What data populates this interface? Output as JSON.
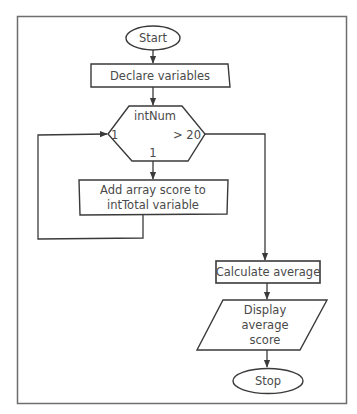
{
  "diagram": {
    "type": "flowchart",
    "colors": {
      "stroke": "#3a3a3a",
      "frame": "#6e6e6e",
      "text": "#4a4a4a",
      "background": "#ffffff"
    },
    "nodes": {
      "start": {
        "shape": "terminator",
        "label": "Start"
      },
      "declare": {
        "shape": "process",
        "label": "Declare variables"
      },
      "loop": {
        "shape": "loop-hexagon",
        "label": "intNum",
        "left_label": "1",
        "right_label": "> 20",
        "bottom_label": "1"
      },
      "add": {
        "shape": "process",
        "line1": "Add array score to",
        "line2": "intTotal variable"
      },
      "calc": {
        "shape": "process",
        "label": "Calculate average"
      },
      "display": {
        "shape": "input-output",
        "line1": "Display",
        "line2": "average",
        "line3": "score"
      },
      "stop": {
        "shape": "terminator",
        "label": "Stop"
      }
    },
    "edges": [
      {
        "from": "start",
        "to": "declare"
      },
      {
        "from": "declare",
        "to": "loop"
      },
      {
        "from": "loop",
        "to": "add",
        "label": "1"
      },
      {
        "from": "add",
        "to": "loop",
        "label": "1"
      },
      {
        "from": "loop",
        "to": "calc",
        "label": "> 20"
      },
      {
        "from": "calc",
        "to": "display"
      },
      {
        "from": "display",
        "to": "stop"
      }
    ]
  }
}
